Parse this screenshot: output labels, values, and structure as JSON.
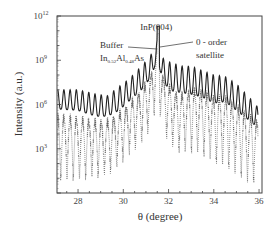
{
  "chart_data": {
    "type": "line",
    "title": "",
    "xlabel": "θ (degree)",
    "ylabel": "Intensity (a.u.)",
    "xlim": [
      27.07,
      36.13
    ],
    "ylim_log10": [
      0,
      12
    ],
    "yscale": "log",
    "x_ticks": [
      28,
      30,
      32,
      34,
      36
    ],
    "x_tick_labels": [
      "28",
      "30",
      "32",
      "34",
      "36"
    ],
    "y_ticks_log10": [
      3,
      6,
      9,
      12
    ],
    "y_tick_labels": [
      {
        "base": "10",
        "exp": "3"
      },
      {
        "base": "10",
        "exp": "6"
      },
      {
        "base": "10",
        "exp": "9"
      },
      {
        "base": "10",
        "exp": "12"
      }
    ],
    "grid": false,
    "legend": null,
    "annotations": [
      {
        "id": "inp",
        "text": "InP(004)",
        "x": 31.55,
        "y_log10": 11.0
      },
      {
        "id": "buffer",
        "line1": "Buffer",
        "line2_parts": [
          {
            "t": "In",
            "sub": false
          },
          {
            "t": "0.52",
            "sub": true
          },
          {
            "t": "Al",
            "sub": false
          },
          {
            "t": "0.48",
            "sub": true
          },
          {
            "t": "As",
            "sub": false
          }
        ],
        "x": 31.45,
        "y_log10": 10.2
      },
      {
        "id": "sat0",
        "line1": "0 - order",
        "line2": "satellite",
        "x": 31.65,
        "y_log10": 10.2
      }
    ],
    "series": [
      {
        "name": "measured",
        "style": "solid",
        "color": "#222222",
        "period_deg": 0.275,
        "envelope_peak_log10": [
          [
            27.1,
            7.0
          ],
          [
            28.0,
            7.0
          ],
          [
            28.8,
            6.7
          ],
          [
            29.3,
            6.6
          ],
          [
            29.8,
            7.2
          ],
          [
            30.3,
            7.8
          ],
          [
            30.8,
            8.6
          ],
          [
            31.2,
            9.3
          ],
          [
            31.5,
            10.4
          ],
          [
            31.8,
            9.0
          ],
          [
            32.2,
            8.8
          ],
          [
            32.6,
            8.6
          ],
          [
            33.0,
            8.6
          ],
          [
            33.5,
            8.3
          ],
          [
            34.0,
            8.0
          ],
          [
            34.5,
            7.9
          ],
          [
            35.0,
            7.4
          ],
          [
            35.5,
            6.6
          ],
          [
            35.9,
            5.9
          ]
        ],
        "envelope_trough_log10": [
          [
            27.1,
            5.7
          ],
          [
            28.0,
            5.6
          ],
          [
            28.8,
            5.2
          ],
          [
            29.3,
            5.2
          ],
          [
            29.8,
            5.6
          ],
          [
            30.3,
            6.3
          ],
          [
            30.8,
            7.0
          ],
          [
            31.2,
            7.8
          ],
          [
            31.5,
            9.0
          ],
          [
            31.8,
            7.4
          ],
          [
            32.2,
            6.9
          ],
          [
            32.6,
            6.8
          ],
          [
            33.0,
            6.7
          ],
          [
            33.5,
            6.5
          ],
          [
            34.0,
            6.1
          ],
          [
            34.5,
            6.2
          ],
          [
            35.0,
            5.6
          ],
          [
            35.5,
            5.0
          ],
          [
            35.9,
            4.5
          ]
        ]
      },
      {
        "name": "simulated",
        "style": "dotted",
        "color": "#444444",
        "period_deg": 0.275,
        "envelope_peak_log10": [
          [
            27.1,
            5.2
          ],
          [
            28.0,
            5.0
          ],
          [
            28.8,
            4.8
          ],
          [
            29.3,
            4.8
          ],
          [
            29.8,
            5.3
          ],
          [
            30.3,
            6.0
          ],
          [
            30.8,
            6.9
          ],
          [
            31.2,
            7.8
          ],
          [
            31.5,
            10.0
          ],
          [
            31.8,
            7.6
          ],
          [
            32.2,
            6.8
          ],
          [
            32.6,
            6.6
          ],
          [
            33.0,
            6.9
          ],
          [
            33.5,
            6.8
          ],
          [
            34.0,
            6.4
          ],
          [
            34.5,
            6.4
          ],
          [
            35.0,
            5.8
          ],
          [
            35.5,
            5.2
          ],
          [
            35.9,
            4.8
          ]
        ],
        "envelope_trough_log10": [
          [
            27.1,
            0.8
          ],
          [
            28.0,
            0.8
          ],
          [
            28.8,
            1.0
          ],
          [
            29.3,
            1.2
          ],
          [
            29.8,
            1.8
          ],
          [
            30.3,
            2.6
          ],
          [
            30.8,
            3.4
          ],
          [
            31.2,
            4.2
          ],
          [
            31.5,
            6.0
          ],
          [
            31.8,
            4.0
          ],
          [
            32.2,
            3.0
          ],
          [
            32.6,
            2.6
          ],
          [
            33.0,
            2.7
          ],
          [
            33.5,
            2.5
          ],
          [
            34.0,
            2.0
          ],
          [
            34.5,
            1.8
          ],
          [
            35.0,
            1.2
          ],
          [
            35.5,
            0.7
          ],
          [
            35.9,
            0.6
          ]
        ]
      }
    ]
  },
  "layout": {
    "plot_left_px": 57,
    "plot_right_px": 262,
    "plot_top_px": 16,
    "plot_bottom_px": 193
  }
}
